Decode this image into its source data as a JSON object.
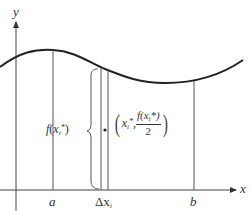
{
  "diagram": {
    "type": "riemann-strip-centroid",
    "axes": {
      "x_label": "x",
      "y_label": "y"
    },
    "interval": {
      "a_label": "a",
      "b_label": "b"
    },
    "strip": {
      "width_label": "Δx",
      "width_subscript": "i"
    },
    "height_label": {
      "fn": "f",
      "var": "x",
      "subscript": "i",
      "star": "*"
    },
    "centroid_label": {
      "x_var": "x",
      "x_subscript": "i",
      "x_star": "*",
      "numerator": "f(x",
      "numerator_subscript": "i",
      "numerator_tail": "*)",
      "denominator": "2"
    },
    "colors": {
      "curve": "#222222",
      "lines": "#555555",
      "text": "#333333",
      "background": "#ffffff"
    }
  }
}
